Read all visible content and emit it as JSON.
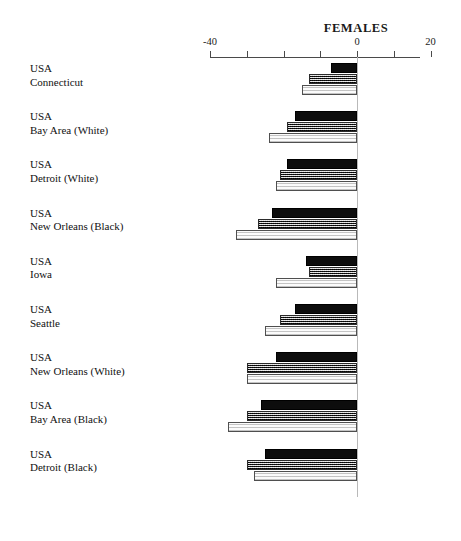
{
  "chart_data": {
    "type": "bar",
    "orientation": "horizontal",
    "title": "FEMALES",
    "xlabel": "",
    "ylabel": "",
    "xlim": [
      -40,
      20
    ],
    "xticks": [
      -40,
      -30,
      -20,
      -10,
      0,
      10,
      20
    ],
    "xtick_labels": [
      "-40",
      "",
      "",
      "",
      "0",
      "",
      "20"
    ],
    "grid": false,
    "legend": "none",
    "categories": [
      "USA\nConnecticut",
      "USA\nBay Area (White)",
      "USA\nDetroit (White)",
      "USA\nNew Orleans (Black)",
      "USA\nIowa",
      "USA\nSeattle",
      "USA\nNew Orleans (White)",
      "USA\nBay Area (Black)",
      "USA\nDetroit (Black)"
    ],
    "series": [
      {
        "name": "series-1-solid",
        "style": "solid-black",
        "values": [
          -7,
          -17,
          -19,
          -23,
          -14,
          -17,
          -22,
          -26,
          -25
        ]
      },
      {
        "name": "series-2-hatched",
        "style": "hatched-gray",
        "values": [
          -13,
          -19,
          -21,
          -27,
          -13,
          -21,
          -30,
          -30,
          -30
        ]
      },
      {
        "name": "series-3-open",
        "style": "open-white",
        "values": [
          -15,
          -24,
          -22,
          -33,
          -22,
          -25,
          -30,
          -35,
          -28
        ]
      }
    ]
  },
  "labels": [
    {
      "country": "USA",
      "region": "Connecticut"
    },
    {
      "country": "USA",
      "region": "Bay Area (White)"
    },
    {
      "country": "USA",
      "region": "Detroit (White)"
    },
    {
      "country": "USA",
      "region": "New Orleans (Black)"
    },
    {
      "country": "USA",
      "region": "Iowa"
    },
    {
      "country": "USA",
      "region": "Seattle"
    },
    {
      "country": "USA",
      "region": "New Orleans (White)"
    },
    {
      "country": "USA",
      "region": "Bay Area (Black)"
    },
    {
      "country": "USA",
      "region": "Detroit (Black)"
    }
  ],
  "colors": {
    "solid": "#0d0d0d",
    "hatched": "#8f8f8f",
    "open": "#fdfdfd",
    "axis": "#4a4a4a",
    "text": "#111111"
  }
}
